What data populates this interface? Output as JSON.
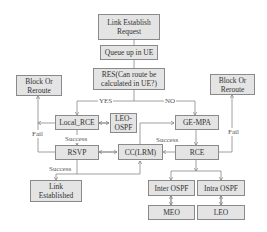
{
  "nodes": {
    "link_request": "Link Establish Request",
    "queue": "Queue up in UE",
    "res": "RES(Can route be calculated in UE?)",
    "block_left": "Block Or Reroute",
    "block_right": "Block Or Reroute",
    "local_rce": "Local_RCE",
    "leo_ospf": "LEO-OSPF",
    "ge_mpa": "GE-MPA",
    "rsvp": "RSVP",
    "cc_lrm": "CC(LRM)",
    "rce": "RCE",
    "link_established": "Link Established",
    "inter_ospf": "Inter OSPF",
    "intra_ospf": "Intra OSPF",
    "meo": "MEO",
    "leo": "LEO"
  },
  "edges": {
    "yes": "YES",
    "no": "NO",
    "fail_left": "Fail",
    "fail_right": "Fail",
    "success_local": "Success",
    "success_rsvp": "Success",
    "success_rce": "Success"
  }
}
